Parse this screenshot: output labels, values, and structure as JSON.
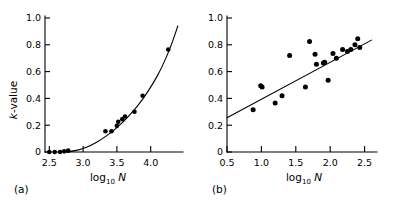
{
  "figure": {
    "background_color": "#ffffff",
    "ink_color": "#000000",
    "panel_captions": [
      "(a)",
      "(b)"
    ]
  },
  "chart_data": [
    {
      "panel": "(a)",
      "type": "scatter",
      "title": "",
      "xlabel": "log10 N",
      "xlabel_base": "log",
      "xlabel_sub": "10",
      "xlabel_var": "N",
      "ylabel": "k-value",
      "ylabel_var": "k",
      "ylabel_rest": "-value",
      "xlim": [
        2.42,
        4.45
      ],
      "ylim": [
        0,
        1.05
      ],
      "xticks": [
        2.5,
        3.0,
        3.5,
        4.0
      ],
      "xticklabels": [
        "2.5",
        "3.0",
        "3.5",
        "4.0"
      ],
      "yticks": [
        0,
        0.2,
        0.4,
        0.6,
        0.8,
        1.0
      ],
      "yticklabels": [
        "0",
        "0.2",
        "0.4",
        "0.6",
        "0.8",
        "1.0"
      ],
      "grid": false,
      "legend": "none",
      "points": [
        [
          2.5,
          0.0
        ],
        [
          2.58,
          0.0
        ],
        [
          2.66,
          0.0
        ],
        [
          2.72,
          0.005
        ],
        [
          2.78,
          0.01
        ],
        [
          3.33,
          0.155
        ],
        [
          3.42,
          0.155
        ],
        [
          3.5,
          0.195
        ],
        [
          3.52,
          0.225
        ],
        [
          3.58,
          0.245
        ],
        [
          3.62,
          0.265
        ],
        [
          3.76,
          0.3
        ],
        [
          3.88,
          0.42
        ],
        [
          4.26,
          0.765
        ]
      ],
      "curve": {
        "description": "smooth increasing fitted curve",
        "points": [
          [
            2.74,
            0.0
          ],
          [
            2.9,
            0.012
          ],
          [
            3.05,
            0.035
          ],
          [
            3.2,
            0.073
          ],
          [
            3.35,
            0.122
          ],
          [
            3.5,
            0.182
          ],
          [
            3.65,
            0.255
          ],
          [
            3.8,
            0.34
          ],
          [
            3.95,
            0.445
          ],
          [
            4.1,
            0.57
          ],
          [
            4.22,
            0.695
          ],
          [
            4.33,
            0.835
          ],
          [
            4.4,
            0.94
          ]
        ]
      }
    },
    {
      "panel": "(b)",
      "type": "scatter",
      "title": "",
      "xlabel": "log10 N",
      "xlabel_base": "log",
      "xlabel_sub": "10",
      "xlabel_var": "N",
      "ylabel": "",
      "xlim": [
        0.5,
        2.68
      ],
      "ylim": [
        0,
        1.05
      ],
      "xticks": [
        0.5,
        1.0,
        1.5,
        2.0,
        2.5
      ],
      "xticklabels": [
        "0.5",
        "1.0",
        "1.5",
        "2.0",
        "2.5"
      ],
      "yticks": [
        0,
        0.2,
        0.4,
        0.6,
        0.8,
        1.0
      ],
      "yticklabels": [
        "0",
        "0.2",
        "0.4",
        "0.6",
        "0.8",
        "1.0"
      ],
      "grid": false,
      "legend": "none",
      "points": [
        [
          0.88,
          0.315
        ],
        [
          0.99,
          0.495
        ],
        [
          1.01,
          0.485
        ],
        [
          1.2,
          0.365
        ],
        [
          1.3,
          0.42
        ],
        [
          1.41,
          0.72
        ],
        [
          1.64,
          0.485
        ],
        [
          1.7,
          0.825
        ],
        [
          1.78,
          0.73
        ],
        [
          1.8,
          0.655
        ],
        [
          1.9,
          0.665
        ],
        [
          1.92,
          0.67
        ],
        [
          1.97,
          0.535
        ],
        [
          2.04,
          0.735
        ],
        [
          2.09,
          0.7
        ],
        [
          2.18,
          0.765
        ],
        [
          2.25,
          0.75
        ],
        [
          2.3,
          0.765
        ],
        [
          2.36,
          0.8
        ],
        [
          2.4,
          0.845
        ],
        [
          2.43,
          0.78
        ]
      ],
      "fit_line": {
        "description": "linear regression line",
        "x0": 0.5,
        "y0": 0.255,
        "x1": 2.6,
        "y1": 0.835
      }
    }
  ]
}
